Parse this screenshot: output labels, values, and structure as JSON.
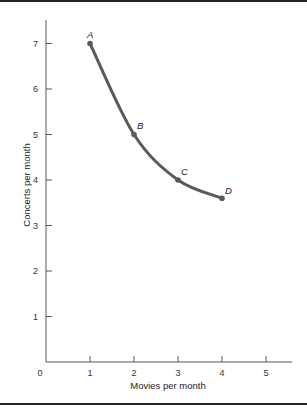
{
  "chart_data": {
    "type": "line",
    "title": "",
    "xlabel": "Movies per month",
    "ylabel": "Concerts per month",
    "xlim": [
      0,
      5.6
    ],
    "ylim": [
      0,
      7.6
    ],
    "x_ticks": [
      1,
      2,
      3,
      4,
      5
    ],
    "y_ticks": [
      1,
      2,
      3,
      4,
      5,
      6,
      7
    ],
    "origin_label": "0",
    "grid": false,
    "legend": "none",
    "series": [
      {
        "name": "indifference-curve",
        "color": "#5a5a5a",
        "smooth": true,
        "points": [
          {
            "label": "A",
            "x": 1,
            "y": 7
          },
          {
            "label": "B",
            "x": 2,
            "y": 5
          },
          {
            "label": "C",
            "x": 3,
            "y": 4
          },
          {
            "label": "D",
            "x": 4,
            "y": 3.6
          }
        ]
      }
    ]
  },
  "frame": {
    "border_color": "#222222"
  }
}
